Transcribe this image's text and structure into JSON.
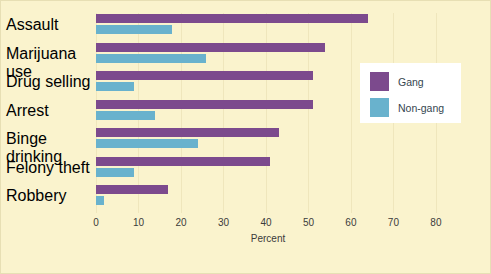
{
  "chart_data": {
    "type": "bar",
    "orientation": "horizontal",
    "title": "",
    "subtitle": "",
    "xlabel": "Percent",
    "ylabel": "",
    "xlim": [
      0,
      81.2
    ],
    "xticks": [
      0,
      10,
      20,
      30,
      40,
      50,
      60,
      70,
      80
    ],
    "xtick_labels": [
      "0",
      "10",
      "20",
      "30",
      "40",
      "50",
      "60",
      "70",
      "80"
    ],
    "grid": true,
    "grid_axis": "x",
    "legend_position": "right",
    "categories": [
      "Assault",
      "Marijuana use",
      "Drug selling",
      "Arrest",
      "Binge drinking",
      "Felony theft",
      "Robbery"
    ],
    "series": [
      {
        "name": "Gang",
        "color": "#7c4a8d",
        "values": [
          64,
          54,
          51,
          51,
          43,
          41,
          17
        ]
      },
      {
        "name": "Non-gang",
        "color": "#69b2cd",
        "values": [
          18,
          26,
          9,
          14,
          24,
          9,
          2
        ]
      }
    ]
  },
  "figure": {
    "background_color": "#faf3cd",
    "border_color": "#e7dfb4",
    "legend_background": "#ffffff"
  }
}
